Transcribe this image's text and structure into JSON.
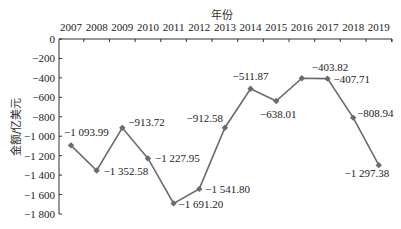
{
  "chart_data": {
    "type": "line",
    "title": "",
    "xlabel": "年份",
    "ylabel": "金额/亿美元",
    "categories": [
      "2007",
      "2008",
      "2009",
      "2010",
      "2011",
      "2012",
      "2013",
      "2014",
      "2015",
      "2016",
      "2017",
      "2018",
      "2019"
    ],
    "series": [
      {
        "name": "金额",
        "values": [
          -1093.99,
          -1352.58,
          -913.72,
          -1227.95,
          -1691.2,
          -1541.8,
          -912.58,
          -511.87,
          -638.01,
          -403.82,
          -407.71,
          -808.94,
          -1297.38
        ],
        "labels": [
          "−1 093.99",
          "−1 352.58",
          "−913.72",
          "−1 227.95",
          "−1 691.20",
          "−1 541.80",
          "−912.58",
          "−511.87",
          "−638.01",
          "−403.82",
          "−407.71",
          "−808.94",
          "−1 297.38"
        ]
      }
    ],
    "yticks": [
      0,
      -200,
      -400,
      -600,
      -800,
      -1000,
      -1200,
      -1400,
      -1600,
      -1800
    ],
    "ytick_labels": [
      "0",
      "−200",
      "−400",
      "−600",
      "−800",
      "−1 000",
      "−1 200",
      "−1 400",
      "−1 600",
      "−1 800"
    ],
    "ylim": [
      -1800,
      0
    ],
    "x_axis_position": "top",
    "grid": false,
    "legend": null,
    "colors": {
      "line": "#6b6b6b",
      "marker": "#6b6b6b",
      "axis": "#333333"
    }
  }
}
